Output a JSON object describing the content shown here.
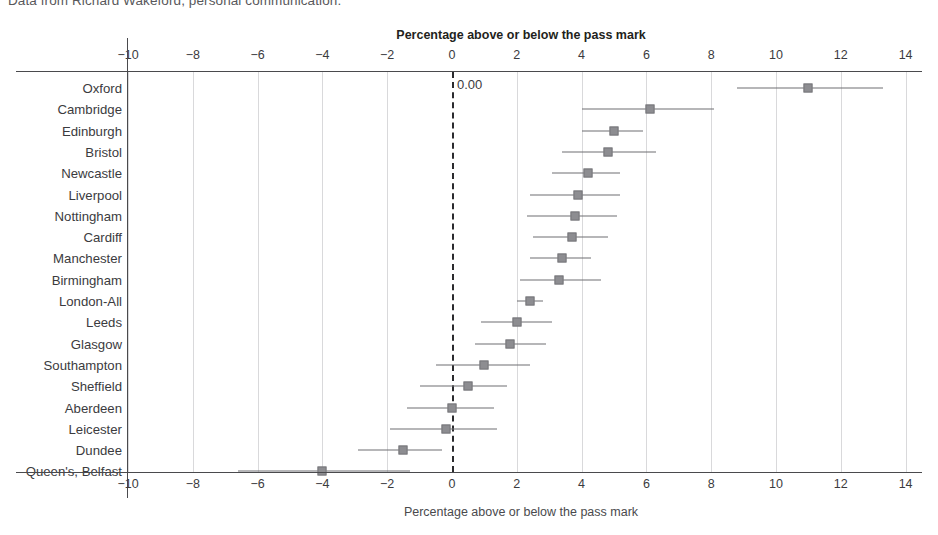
{
  "caption": "Data from Richard Wakeford, personal communication.",
  "chart_data": {
    "type": "scatter",
    "subtype": "forest-plot",
    "title": "Percentage above or below the pass mark",
    "xlabel": "Percentage above or below the pass mark",
    "xlabel_bottom": "Percentage above or below the pass mark",
    "ylabel": "",
    "xlim": [
      -11,
      15
    ],
    "xticks": [
      -10,
      -8,
      -6,
      -4,
      -2,
      0,
      2,
      4,
      6,
      8,
      10,
      12,
      14
    ],
    "xticklabels": [
      "−10",
      "−8",
      "−6",
      "−4",
      "−2",
      "0",
      "2",
      "4",
      "6",
      "8",
      "10",
      "12",
      "14"
    ],
    "grid": "vertical",
    "reference_line": {
      "value": 0,
      "label": "0.00",
      "style": "dashed"
    },
    "legend": null,
    "marker_color": "#8d8d91",
    "ci_color": "#6f6f73",
    "categories": [
      "Oxford",
      "Cambridge",
      "Edinburgh",
      "Bristol",
      "Newcastle",
      "Liverpool",
      "Nottingham",
      "Cardiff",
      "Manchester",
      "Birmingham",
      "London-All",
      "Leeds",
      "Glasgow",
      "Southampton",
      "Sheffield",
      "Aberdeen",
      "Leicester",
      "Dundee",
      "Queen's, Belfast"
    ],
    "points": [
      {
        "label": "Oxford",
        "value": 11.0,
        "ci_low": 8.8,
        "ci_high": 13.3
      },
      {
        "label": "Cambridge",
        "value": 6.1,
        "ci_low": 4.0,
        "ci_high": 8.1
      },
      {
        "label": "Edinburgh",
        "value": 5.0,
        "ci_low": 4.0,
        "ci_high": 5.9
      },
      {
        "label": "Bristol",
        "value": 4.8,
        "ci_low": 3.4,
        "ci_high": 6.3
      },
      {
        "label": "Newcastle",
        "value": 4.2,
        "ci_low": 3.1,
        "ci_high": 5.2
      },
      {
        "label": "Liverpool",
        "value": 3.9,
        "ci_low": 2.4,
        "ci_high": 5.2
      },
      {
        "label": "Nottingham",
        "value": 3.8,
        "ci_low": 2.3,
        "ci_high": 5.1
      },
      {
        "label": "Cardiff",
        "value": 3.7,
        "ci_low": 2.5,
        "ci_high": 4.8
      },
      {
        "label": "Manchester",
        "value": 3.4,
        "ci_low": 2.4,
        "ci_high": 4.3
      },
      {
        "label": "Birmingham",
        "value": 3.3,
        "ci_low": 2.1,
        "ci_high": 4.6
      },
      {
        "label": "London-All",
        "value": 2.4,
        "ci_low": 2.0,
        "ci_high": 2.8
      },
      {
        "label": "Leeds",
        "value": 2.0,
        "ci_low": 0.9,
        "ci_high": 3.1
      },
      {
        "label": "Glasgow",
        "value": 1.8,
        "ci_low": 0.7,
        "ci_high": 2.9
      },
      {
        "label": "Southampton",
        "value": 1.0,
        "ci_low": -0.5,
        "ci_high": 2.4
      },
      {
        "label": "Sheffield",
        "value": 0.5,
        "ci_low": -1.0,
        "ci_high": 1.7
      },
      {
        "label": "Aberdeen",
        "value": 0.0,
        "ci_low": -1.4,
        "ci_high": 1.3
      },
      {
        "label": "Leicester",
        "value": -0.2,
        "ci_low": -1.9,
        "ci_high": 1.4
      },
      {
        "label": "Dundee",
        "value": -1.5,
        "ci_low": -2.9,
        "ci_high": -0.3
      },
      {
        "label": "Queen's, Belfast",
        "value": -4.0,
        "ci_low": -6.6,
        "ci_high": -1.3
      }
    ]
  }
}
